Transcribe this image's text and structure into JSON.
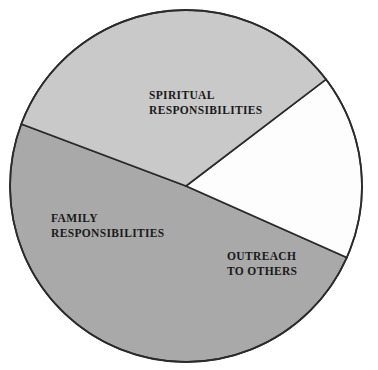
{
  "chart_data": {
    "type": "pie",
    "title": "",
    "subtitle": "",
    "xlabel": "",
    "ylabel": "",
    "legend_position": "none",
    "grid": false,
    "labels_inside_slices": true,
    "start_angle_deg": 159.4,
    "direction": "counterclockwise",
    "categories": [
      "SPIRITUAL RESPONSIBILITIES",
      "OUTREACH TO OTHERS",
      "FAMILY RESPONSIBILITIES"
    ],
    "values": [
      49,
      17,
      34
    ],
    "value_unit": "percent",
    "slice_angles_deg": [
      176.6,
      61.3,
      122.1
    ],
    "slice_colors": [
      "#a9a9a9",
      "#fdfdfd",
      "#c9c9c9"
    ],
    "slices": [
      {
        "name": "SPIRITUAL RESPONSIBILITIES",
        "label_line1": "SPIRITUAL",
        "label_line2": "RESPONSIBILITIES",
        "value": 49,
        "angle_deg": 176.6,
        "color": "#a9a9a9"
      },
      {
        "name": "OUTREACH TO OTHERS",
        "label_line1": "OUTREACH",
        "label_line2": "TO OTHERS",
        "value": 17,
        "angle_deg": 61.3,
        "color": "#fdfdfd"
      },
      {
        "name": "FAMILY RESPONSIBILITIES",
        "label_line1": "FAMILY",
        "label_line2": "RESPONSIBILITIES",
        "value": 34,
        "angle_deg": 122.1,
        "color": "#c9c9c9"
      }
    ]
  },
  "figure": {
    "background_color": "#ffffff",
    "outline_color": "#2b2b2b",
    "label_text_color": "#1a1a1a",
    "center_x": 186,
    "center_y": 186,
    "radius": 176
  }
}
